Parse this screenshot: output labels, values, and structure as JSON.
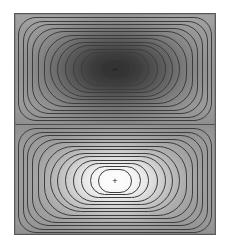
{
  "figure": {
    "title": "",
    "background_color": "#ffffff",
    "frame_color": "#5a5a5a"
  },
  "chart_data": {
    "type": "heatmap",
    "title": "",
    "subtitle": "",
    "xlabel": "",
    "ylabel": "",
    "grid": false,
    "legend": "none",
    "colormap": "gray",
    "xlim": [
      0,
      1
    ],
    "ylim": [
      0,
      1
    ],
    "xticks": [],
    "yticks": [],
    "xticklabels": [],
    "yticklabels": [],
    "panels": [
      {
        "name": "negative-lobe",
        "position": "top",
        "extremum_sign": "-",
        "extremum_label": "−",
        "extremum_xy": [
          0.5,
          0.75
        ],
        "center_value": -1.0,
        "edge_value": 0.0,
        "core_color": "#323232",
        "edge_color": "#9a9a9a",
        "contour_count": 13,
        "contour_levels": [
          -0.95,
          -0.88,
          -0.8,
          -0.72,
          -0.64,
          -0.56,
          -0.48,
          -0.4,
          -0.32,
          -0.24,
          -0.16,
          -0.1,
          -0.05
        ]
      },
      {
        "name": "positive-lobe",
        "position": "bottom",
        "extremum_sign": "+",
        "extremum_label": "+",
        "extremum_xy": [
          0.5,
          0.25
        ],
        "center_value": 1.0,
        "edge_value": 0.0,
        "core_color": "#fdfdfd",
        "edge_color": "#9a9a9a",
        "contour_count": 13,
        "contour_levels": [
          0.95,
          0.88,
          0.8,
          0.72,
          0.64,
          0.56,
          0.48,
          0.4,
          0.32,
          0.24,
          0.16,
          0.1,
          0.05
        ]
      }
    ],
    "contour_line_color": "#3d3d3d",
    "divider": {
      "name": "nodal-line",
      "orientation": "horizontal",
      "value": 0.0,
      "color": "#4e4e4e"
    },
    "ring_geometry": [
      {
        "inset_x": 3.0,
        "inset_y": 3.0,
        "radius": 18
      },
      {
        "inset_x": 7.5,
        "inset_y": 6.5,
        "radius": 20
      },
      {
        "inset_x": 12.0,
        "inset_y": 10.0,
        "radius": 22
      },
      {
        "inset_x": 17.0,
        "inset_y": 13.5,
        "radius": 24
      },
      {
        "inset_x": 22.5,
        "inset_y": 17.0,
        "radius": 26
      },
      {
        "inset_x": 28.5,
        "inset_y": 20.5,
        "radius": 29
      },
      {
        "inset_x": 35.0,
        "inset_y": 24.0,
        "radius": 32
      },
      {
        "inset_x": 42.0,
        "inset_y": 27.5,
        "radius": 36
      },
      {
        "inset_x": 49.5,
        "inset_y": 31.0,
        "radius": 40
      },
      {
        "inset_x": 57.5,
        "inset_y": 34.5,
        "radius": 46
      },
      {
        "inset_x": 66.0,
        "inset_y": 38.0,
        "radius": 54
      },
      {
        "inset_x": 74.5,
        "inset_y": 41.0,
        "radius": 60
      },
      {
        "inset_x": 83.0,
        "inset_y": 43.5,
        "radius": 70
      }
    ]
  }
}
